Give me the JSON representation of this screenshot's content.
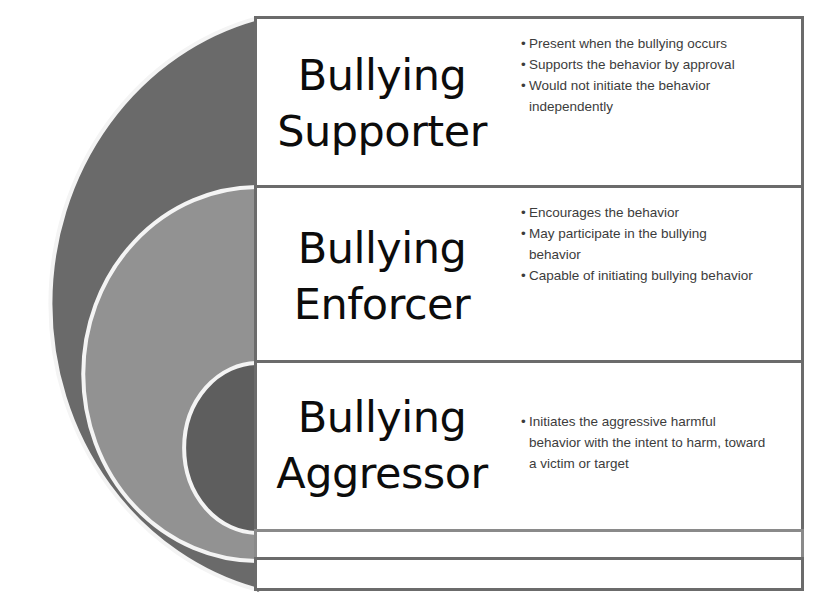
{
  "diagram": {
    "type": "nested-circles-with-labels",
    "colors": {
      "outer_ring": "#6a6a6a",
      "middle_ring": "#909090",
      "inner_circle": "#5e5e5e",
      "ring_outline": "#f4f4f4",
      "box_border": "#6b6b6b",
      "box_fill": "#ffffff"
    },
    "rows": [
      {
        "title_line1": "Bullying",
        "title_line2": "Supporter",
        "bullets": [
          "Present when the bullying occurs",
          "Supports the behavior by approval",
          "Would not initiate the behavior independently"
        ]
      },
      {
        "title_line1": "Bullying",
        "title_line2": "Enforcer",
        "bullets": [
          "Encourages the behavior",
          "May participate in the bullying behavior",
          "Capable of initiating bullying behavior"
        ]
      },
      {
        "title_line1": "Bullying",
        "title_line2": "Aggressor",
        "bullets": [
          "Initiates the aggressive harmful behavior with the intent to harm, toward a victim or target"
        ]
      }
    ]
  }
}
